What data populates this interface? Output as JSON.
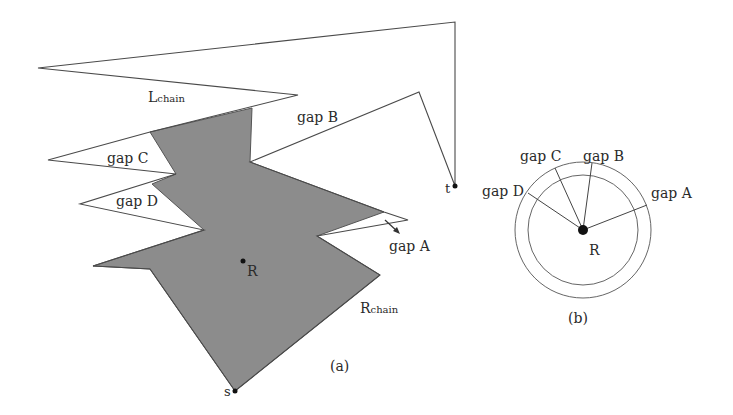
{
  "figure_a": {
    "caption": "(a)",
    "labels": {
      "l_chain_main": "L",
      "l_chain_sub": "chain",
      "r_chain_main": "R",
      "r_chain_sub": "chain",
      "gap_a": "gap A",
      "gap_b": "gap B",
      "gap_c": "gap C",
      "gap_d": "gap D",
      "point_r": "R",
      "point_s": "s",
      "point_t": "t"
    },
    "colors": {
      "region_fill": "#8c8c8c",
      "outline": "#4a4a4a"
    }
  },
  "figure_b": {
    "caption": "(b)",
    "labels": {
      "gap_a": "gap A",
      "gap_b": "gap B",
      "gap_c": "gap C",
      "gap_d": "gap D",
      "center": "R"
    }
  }
}
